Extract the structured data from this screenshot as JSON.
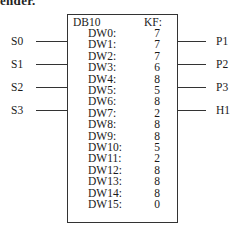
{
  "heading_fragment": "ender.",
  "block": {
    "title": "DB10",
    "column_header": "KF:",
    "rows": [
      {
        "name": "DW0:",
        "value": "7"
      },
      {
        "name": "DW1:",
        "value": "7"
      },
      {
        "name": "DW2:",
        "value": "7"
      },
      {
        "name": "DW3:",
        "value": "6"
      },
      {
        "name": "DW4:",
        "value": "8"
      },
      {
        "name": "DW5:",
        "value": "5"
      },
      {
        "name": "DW6:",
        "value": "8"
      },
      {
        "name": "DW7:",
        "value": "2"
      },
      {
        "name": "DW8:",
        "value": "8"
      },
      {
        "name": "DW9:",
        "value": "8"
      },
      {
        "name": "DW10:",
        "value": "5"
      },
      {
        "name": "DW11:",
        "value": "2"
      },
      {
        "name": "DW12:",
        "value": "8"
      },
      {
        "name": "DW13:",
        "value": "8"
      },
      {
        "name": "DW14:",
        "value": "8"
      },
      {
        "name": "DW15:",
        "value": "0"
      }
    ]
  },
  "inputs": [
    "S0",
    "S1",
    "S2",
    "S3"
  ],
  "outputs": [
    "P1",
    "P2",
    "P3",
    "H1"
  ]
}
